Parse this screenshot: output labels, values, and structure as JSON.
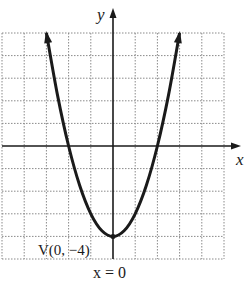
{
  "chart_data": {
    "type": "line",
    "title": "",
    "function": "y = x^2 - 4",
    "series": [
      {
        "name": "parabola",
        "x": [
          -3,
          -2.5,
          -2,
          -1.5,
          -1,
          -0.5,
          0,
          0.5,
          1,
          1.5,
          2,
          2.5,
          3
        ],
        "y": [
          5,
          2.25,
          0,
          -1.75,
          -3,
          -3.75,
          -4,
          -3.75,
          -3,
          -1.75,
          0,
          2.25,
          5
        ]
      }
    ],
    "xlabel": "x",
    "ylabel": "y",
    "xlim": [
      -5,
      5
    ],
    "ylim": [
      -5,
      5
    ],
    "grid": true,
    "grid_step": 1,
    "annotations": [
      {
        "text": "V(0, −4)",
        "x": 0,
        "y": -4,
        "kind": "vertex"
      },
      {
        "text": "x = 0",
        "kind": "axis-of-symmetry"
      }
    ],
    "colors": {
      "curve": "#1a1a1a",
      "axes": "#1a1a1a",
      "grid": "#8a8a8a"
    }
  }
}
